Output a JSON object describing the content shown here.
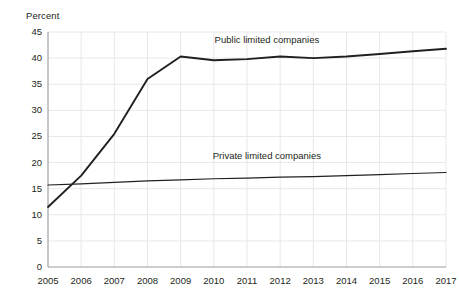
{
  "chart_data": {
    "type": "line",
    "title": "",
    "subtitle": "",
    "xlabel": "",
    "ylabel": "Percent",
    "ylim": [
      0,
      45
    ],
    "xlim": [
      2005,
      2017
    ],
    "grid": true,
    "grid_color": "#e8e8ec",
    "legend_position": "inline-annotation",
    "line_color": "#231f20",
    "background": "#ffffff",
    "x": [
      2005,
      2006,
      2007,
      2008,
      2009,
      2010,
      2011,
      2012,
      2013,
      2014,
      2015,
      2016,
      2017
    ],
    "categories": [
      "2005",
      "2006",
      "2007",
      "2008",
      "2009",
      "2010",
      "2011",
      "2012",
      "2013",
      "2014",
      "2015",
      "2016",
      "2017"
    ],
    "y_ticks": [
      0,
      5,
      10,
      15,
      20,
      25,
      30,
      35,
      40,
      45
    ],
    "y_tick_labels": [
      "0",
      "5",
      "10",
      "15",
      "20",
      "25",
      "30",
      "35",
      "40",
      "45"
    ],
    "series": [
      {
        "name": "Public limited companies",
        "values": [
          11.5,
          17.5,
          25.5,
          36.0,
          40.3,
          39.6,
          39.8,
          40.3,
          40.0,
          40.3,
          40.8,
          41.3,
          41.8
        ],
        "label_x": 2011.6,
        "label_y": 43.4
      },
      {
        "name": "Private limited companies",
        "values": [
          15.7,
          15.9,
          16.2,
          16.5,
          16.7,
          16.9,
          17.0,
          17.2,
          17.3,
          17.5,
          17.7,
          17.9,
          18.1
        ],
        "label_x": 2011.6,
        "label_y": 21.2
      }
    ]
  },
  "annotations": {
    "percent_caption": "Percent",
    "public_label": "Public limited companies",
    "private_label": "Private limited companies"
  }
}
